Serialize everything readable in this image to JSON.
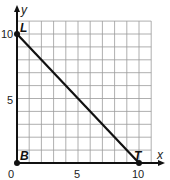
{
  "chart_data": {
    "type": "line",
    "title": "",
    "xlabel": "x",
    "ylabel": "y",
    "xlim": [
      0,
      11
    ],
    "ylim": [
      0,
      11
    ],
    "grid": true,
    "x_ticks": [
      "0",
      "5",
      "10"
    ],
    "y_ticks": [
      "5",
      "10"
    ],
    "points": [
      {
        "label": "L",
        "x": 0,
        "y": 10
      },
      {
        "label": "B",
        "x": 0,
        "y": 0
      },
      {
        "label": "T",
        "x": 10,
        "y": 0
      }
    ],
    "segments": [
      {
        "from": "L",
        "to": "T"
      },
      {
        "from": "B",
        "to": "T"
      },
      {
        "from": "B",
        "to": "L"
      }
    ],
    "colors": {
      "line": "#111111",
      "grid": "#999999"
    }
  },
  "labels": {
    "x_axis": "x",
    "y_axis": "y",
    "origin": "0",
    "x5": "5",
    "x10": "10",
    "y5": "5",
    "y10": "10",
    "L": "L",
    "B": "B",
    "T": "T"
  }
}
